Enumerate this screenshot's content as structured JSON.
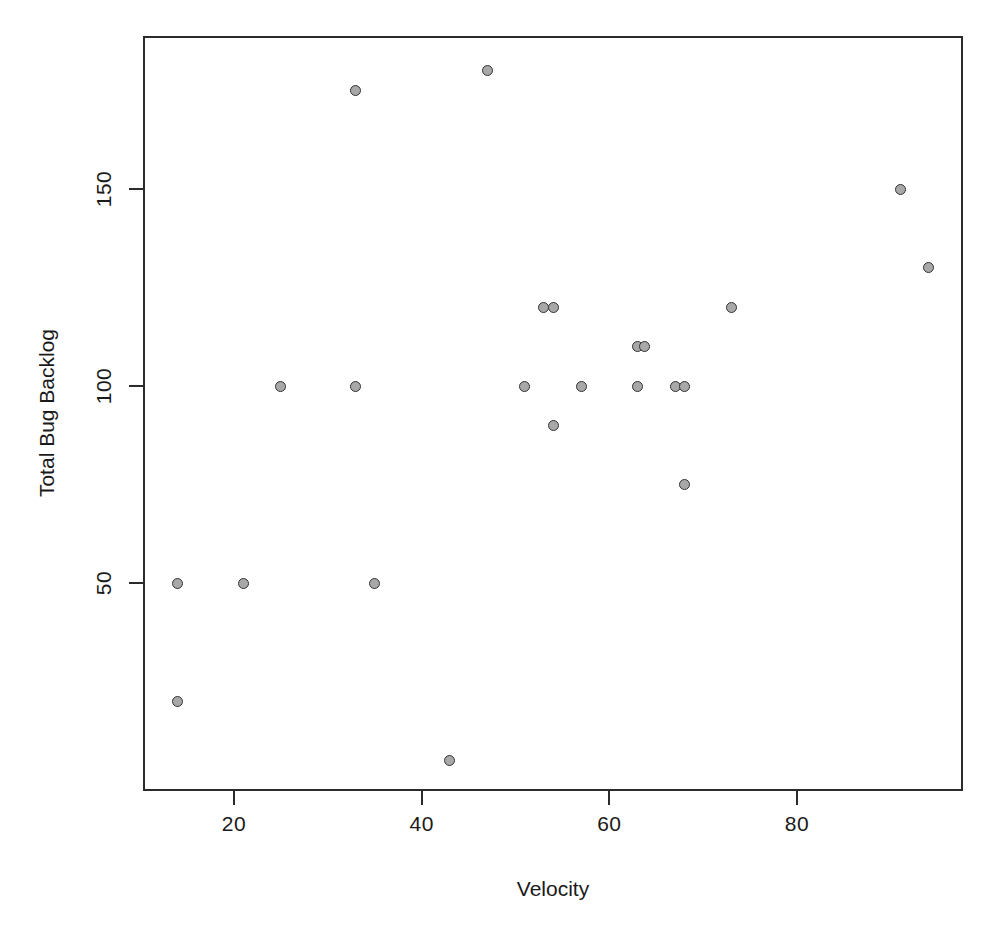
{
  "chart_data": {
    "type": "scatter",
    "title": "",
    "xlabel": "Velocity",
    "ylabel": "Total Bug Backlog",
    "xlim": [
      11,
      98
    ],
    "ylim": [
      -5,
      192
    ],
    "xticks": [
      20,
      40,
      60,
      80
    ],
    "yticks": [
      50,
      100,
      150
    ],
    "grid": false,
    "legend": null,
    "marker": {
      "shape": "circle",
      "fill_color": "#a8a8a8",
      "border_color": "#333333",
      "size_px": 11
    },
    "x": [
      14,
      14,
      21,
      25,
      33,
      33,
      35,
      43,
      47,
      51,
      53,
      54,
      54,
      57,
      63,
      63,
      63,
      67,
      68,
      68,
      73,
      91,
      94
    ],
    "y": [
      50,
      20,
      50,
      100,
      175,
      100,
      50,
      5,
      180,
      100,
      120,
      120,
      90,
      100,
      110,
      110,
      100,
      100,
      100,
      75,
      120,
      150,
      130
    ],
    "points": [
      {
        "x": 14,
        "y": 50
      },
      {
        "x": 14,
        "y": 20
      },
      {
        "x": 21,
        "y": 50
      },
      {
        "x": 25,
        "y": 100
      },
      {
        "x": 33,
        "y": 175
      },
      {
        "x": 33,
        "y": 100
      },
      {
        "x": 35,
        "y": 50
      },
      {
        "x": 43,
        "y": 5
      },
      {
        "x": 47,
        "y": 180
      },
      {
        "x": 51,
        "y": 100
      },
      {
        "x": 53,
        "y": 120
      },
      {
        "x": 54,
        "y": 120
      },
      {
        "x": 54,
        "y": 90
      },
      {
        "x": 57,
        "y": 100
      },
      {
        "x": 63,
        "y": 110
      },
      {
        "x": 63.8,
        "y": 110
      },
      {
        "x": 63,
        "y": 100
      },
      {
        "x": 67,
        "y": 100
      },
      {
        "x": 68,
        "y": 100
      },
      {
        "x": 68,
        "y": 75
      },
      {
        "x": 73,
        "y": 120
      },
      {
        "x": 91,
        "y": 150
      },
      {
        "x": 94,
        "y": 130
      }
    ]
  },
  "axes": {
    "x_tick_labels": [
      "20",
      "40",
      "60",
      "80"
    ],
    "y_tick_labels": [
      "50",
      "100",
      "150"
    ],
    "x_title": "Velocity",
    "y_title": "Total Bug Backlog"
  },
  "style": {
    "frame_color": "#2b2b2b",
    "background": "#ffffff",
    "text_color": "#1a1a1a"
  }
}
